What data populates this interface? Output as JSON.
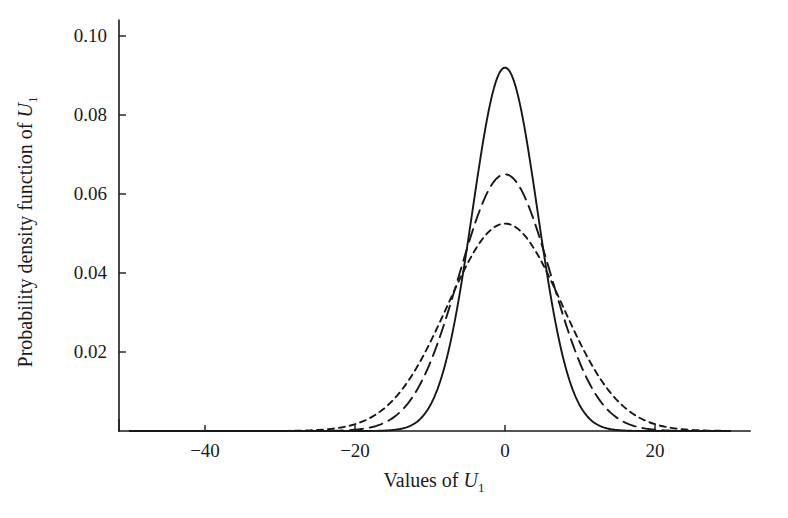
{
  "chart_data": {
    "type": "line",
    "title": "",
    "xlabel": "Values of U1",
    "xlabel_parts": {
      "text": "Values of ",
      "italic": "U",
      "sub": "1"
    },
    "ylabel": "Probability density function of U1",
    "ylabel_parts": {
      "text": "Probability density function of ",
      "italic": "U",
      "sub": "1"
    },
    "xlim": [
      -50,
      30
    ],
    "ylim": [
      0,
      0.105
    ],
    "xticks": [
      -40,
      -20,
      0,
      20
    ],
    "xtick_labels": [
      "−40",
      "−20",
      "0",
      "20"
    ],
    "yticks": [
      0.02,
      0.04,
      0.06,
      0.08,
      0.1
    ],
    "ytick_labels": [
      "0.02",
      "0.04",
      "0.06",
      "0.08",
      "0.10"
    ],
    "grid": false,
    "legend": "none",
    "line_color": "#15181a",
    "background": "#ffffff",
    "series": [
      {
        "name": "solid",
        "linestyle": "solid",
        "dasharray": "",
        "width": 1.9,
        "distribution": "gaussian",
        "mean": 0,
        "sigma": 4.33,
        "peak": 0.092,
        "x": [
          -30,
          -26,
          -22,
          -18,
          -15,
          -13,
          -11,
          -9,
          -7,
          -5,
          -3,
          -1,
          0,
          1,
          3,
          5,
          7,
          9,
          11,
          13,
          15,
          18,
          22,
          26,
          30
        ],
        "y": [
          0.0,
          0.0,
          0.0,
          0.0002,
          0.0005,
          0.0015,
          0.0039,
          0.009,
          0.0184,
          0.0333,
          0.0534,
          0.0877,
          0.092,
          0.0877,
          0.0534,
          0.0333,
          0.0184,
          0.009,
          0.0039,
          0.0015,
          0.0005,
          0.0002,
          0.0,
          0.0,
          0.0
        ]
      },
      {
        "name": "long-dash",
        "linestyle": "dashed",
        "dasharray": "13,7",
        "width": 1.9,
        "distribution": "gaussian",
        "mean": 0,
        "sigma": 6.13,
        "peak": 0.065,
        "x": [
          -30,
          -26,
          -22,
          -18,
          -15,
          -13,
          -11,
          -9,
          -7,
          -5,
          -3,
          -1,
          0,
          1,
          3,
          5,
          7,
          9,
          11,
          13,
          15,
          18,
          22,
          26,
          30
        ],
        "y": [
          0.0,
          0.0001,
          0.0005,
          0.0027,
          0.0072,
          0.0127,
          0.0202,
          0.0294,
          0.0389,
          0.0475,
          0.0561,
          0.0641,
          0.065,
          0.0641,
          0.0561,
          0.0475,
          0.0389,
          0.0294,
          0.0202,
          0.0127,
          0.0072,
          0.0027,
          0.0005,
          0.0001,
          0.0
        ]
      },
      {
        "name": "short-dash",
        "linestyle": "dotted-dash",
        "dasharray": "6,5",
        "width": 1.9,
        "distribution": "gaussian",
        "mean": 0,
        "sigma": 7.65,
        "peak": 0.0525,
        "x": [
          -30,
          -26,
          -22,
          -18,
          -15,
          -13,
          -11,
          -9,
          -7,
          -5,
          -3,
          -1,
          0,
          1,
          3,
          5,
          7,
          9,
          11,
          13,
          15,
          18,
          22,
          26,
          30
        ],
        "y": [
          0.0,
          0.0005,
          0.0034,
          0.0103,
          0.0193,
          0.0264,
          0.0337,
          0.0405,
          0.045,
          0.0489,
          0.0514,
          0.0524,
          0.0525,
          0.0524,
          0.0514,
          0.0489,
          0.045,
          0.0405,
          0.0337,
          0.0264,
          0.0193,
          0.0103,
          0.0034,
          0.0005,
          0.0
        ]
      }
    ]
  },
  "axes": {
    "y_tick_labels": [
      "0.10",
      "0.08",
      "0.06",
      "0.04",
      "0.02"
    ],
    "x_tick_labels": [
      "−40",
      "−20",
      "0",
      "20"
    ]
  }
}
